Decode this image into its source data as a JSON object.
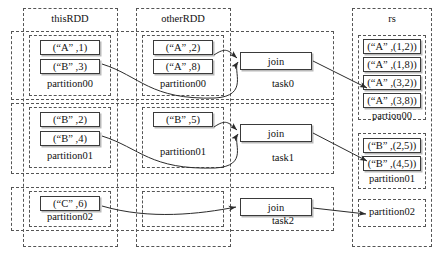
{
  "diagram": {
    "columns": [
      {
        "id": "thisRDD",
        "label": "thisRDD"
      },
      {
        "id": "otherRDD",
        "label": "otherRDD"
      },
      {
        "id": "rs",
        "label": "rs"
      }
    ],
    "tasks": [
      {
        "id": "task0",
        "label": "task0",
        "op_label": "join"
      },
      {
        "id": "task1",
        "label": "task1",
        "op_label": "join"
      },
      {
        "id": "task2",
        "label": "task2",
        "op_label": "join"
      }
    ],
    "thisRDD": {
      "partitions": [
        {
          "label": "partition00",
          "cells": [
            "(“A” ,1)",
            "(“B” ,3)"
          ]
        },
        {
          "label": "partition01",
          "cells": [
            "(“B” ,2)",
            "(“B” ,4)"
          ]
        },
        {
          "label": "partition02",
          "cells": [
            "(“C” ,6)"
          ]
        }
      ]
    },
    "otherRDD": {
      "partitions": [
        {
          "label": "partition00",
          "cells": [
            "(“A” ,2)",
            "(“A” ,8)"
          ]
        },
        {
          "label": "partition01",
          "cells": [
            "(“B” ,5)"
          ]
        },
        {
          "label": "",
          "cells": []
        }
      ]
    },
    "rs": {
      "partitions": [
        {
          "label": "partion00",
          "cells": [
            "(“A” ,(1,2))",
            "(“A” ,(1,8))",
            "(“A” ,(3,2))",
            "(“A” ,(3,8))"
          ]
        },
        {
          "label": "partition01",
          "cells": [
            "(“B” ,(2,5))",
            "(“B” ,(4,5))"
          ]
        },
        {
          "label": "partition02",
          "cells": []
        }
      ]
    },
    "colors": {
      "dashed_border": "#555555",
      "solid_border": "#3a3a3a",
      "shadow": "#b9b9b9",
      "arrow": "#2b2b2b",
      "text": "#111111",
      "background": "#ffffff"
    }
  }
}
